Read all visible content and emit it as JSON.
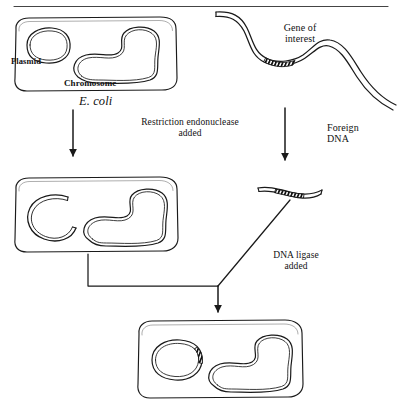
{
  "figure": {
    "width": 402,
    "height": 415,
    "background_color": "#ffffff",
    "ink_color": "#1a1a1a",
    "top_rule": true
  },
  "labels": {
    "plasmid": "Plasmid",
    "chromosome": "Chromosome",
    "ecoli": "E. coli",
    "gene_of_interest": "Gene of\ninterest",
    "foreign_dna": "Foreign\nDNA",
    "restriction_step": "Restriction endonuclease\nadded",
    "ligase_step": "DNA ligase\nadded"
  },
  "stages": [
    {
      "id": "stage-1-left",
      "name": "E. coli cell with intact plasmid and chromosome",
      "contents": [
        "plasmid",
        "chromosome"
      ]
    },
    {
      "id": "stage-1-right",
      "name": "Foreign DNA strand containing gene of interest",
      "contents": [
        "gene-of-interest-segment"
      ]
    },
    {
      "id": "stage-2-left",
      "name": "E. coli cell with cut (linearized) plasmid",
      "contents": [
        "cut-plasmid",
        "chromosome"
      ]
    },
    {
      "id": "stage-2-right",
      "name": "Excised DNA fragment carrying gene of interest",
      "contents": [
        "gene-of-interest-segment"
      ]
    },
    {
      "id": "stage-3",
      "name": "E. coli cell with recombinant plasmid",
      "contents": [
        "recombinant-plasmid",
        "chromosome"
      ]
    }
  ],
  "arrows": [
    {
      "id": "arrow-left-down",
      "from": "stage-1-left",
      "to": "stage-2-left",
      "label": "restriction_step"
    },
    {
      "id": "arrow-right-down",
      "from": "stage-1-right",
      "to": "stage-2-right",
      "label": "restriction_step"
    },
    {
      "id": "arrow-merge-down",
      "from": "stage-2-left + stage-2-right",
      "to": "stage-3",
      "label": "ligase_step"
    }
  ]
}
